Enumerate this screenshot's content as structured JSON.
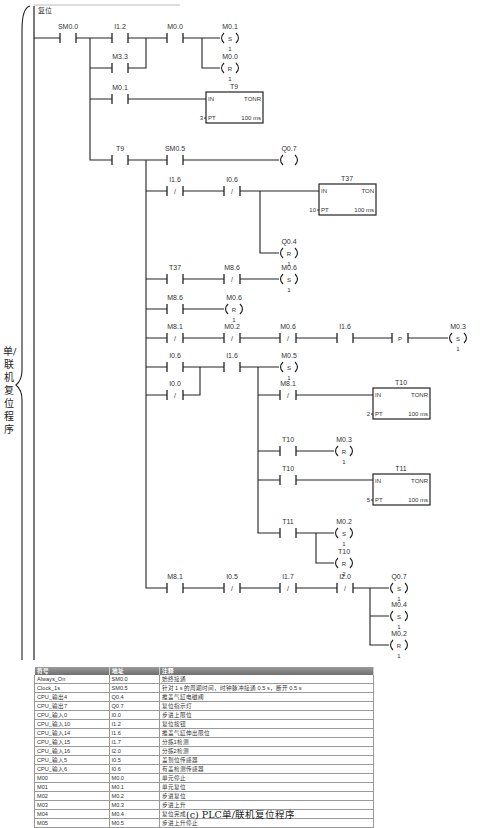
{
  "network": {
    "title": "复位"
  },
  "side_label": "单/联机复位程序",
  "caption": "(c) PLC单/联机复位程序",
  "ladder": {
    "contacts": [
      {
        "id": "c1",
        "label": "SM0.0",
        "x": 68,
        "y": 38,
        "nc": false
      },
      {
        "id": "c2",
        "label": "I1.2",
        "x": 120,
        "y": 38,
        "nc": false
      },
      {
        "id": "c3",
        "label": "M0.0",
        "x": 175,
        "y": 38,
        "nc": false
      },
      {
        "id": "c4",
        "label": "M3.3",
        "x": 120,
        "y": 68,
        "nc": false
      },
      {
        "id": "c5",
        "label": "M0.1",
        "x": 120,
        "y": 99,
        "nc": false
      },
      {
        "id": "c6",
        "label": "T9",
        "x": 120,
        "y": 160,
        "nc": false
      },
      {
        "id": "c7",
        "label": "SM0.5",
        "x": 175,
        "y": 160,
        "nc": false
      },
      {
        "id": "c8",
        "label": "I1.6",
        "x": 175,
        "y": 191,
        "nc": true
      },
      {
        "id": "c9",
        "label": "I0.6",
        "x": 232,
        "y": 191,
        "nc": true
      },
      {
        "id": "c10",
        "label": "T37",
        "x": 175,
        "y": 279,
        "nc": false
      },
      {
        "id": "c11",
        "label": "M8.6",
        "x": 232,
        "y": 279,
        "nc": true
      },
      {
        "id": "c12",
        "label": "M8.6",
        "x": 175,
        "y": 309,
        "nc": false
      },
      {
        "id": "c13",
        "label": "M8.1",
        "x": 175,
        "y": 338,
        "nc": true
      },
      {
        "id": "c14",
        "label": "M0.2",
        "x": 232,
        "y": 338,
        "nc": true
      },
      {
        "id": "c15",
        "label": "M0.6",
        "x": 288,
        "y": 338,
        "nc": true
      },
      {
        "id": "c16",
        "label": "I1.6",
        "x": 345,
        "y": 338,
        "nc": false
      },
      {
        "id": "c17",
        "label": "I0.6",
        "x": 175,
        "y": 367,
        "nc": false
      },
      {
        "id": "c18",
        "label": "I1.6",
        "x": 232,
        "y": 367,
        "nc": false
      },
      {
        "id": "c19",
        "label": "I0.0",
        "x": 175,
        "y": 395,
        "nc": true
      },
      {
        "id": "c20",
        "label": "M8.1",
        "x": 288,
        "y": 395,
        "nc": true
      },
      {
        "id": "c21",
        "label": "T10",
        "x": 288,
        "y": 451,
        "nc": false
      },
      {
        "id": "c22",
        "label": "T10",
        "x": 288,
        "y": 480,
        "nc": false
      },
      {
        "id": "c23",
        "label": "T11",
        "x": 288,
        "y": 533,
        "nc": false
      },
      {
        "id": "c24",
        "label": "M8.1",
        "x": 175,
        "y": 588,
        "nc": false
      },
      {
        "id": "c25",
        "label": "I0.5",
        "x": 232,
        "y": 588,
        "nc": true
      },
      {
        "id": "c26",
        "label": "I1.7",
        "x": 288,
        "y": 588,
        "nc": true
      },
      {
        "id": "c27",
        "label": "I2.0",
        "x": 345,
        "y": 588,
        "nc": true
      }
    ],
    "coils": [
      {
        "label": "M0.1",
        "type": "S",
        "n": "1",
        "x": 228,
        "y": 38
      },
      {
        "label": "M0.0",
        "type": "R",
        "n": "1",
        "x": 228,
        "y": 68
      },
      {
        "label": "Q0.7",
        "type": "",
        "n": "",
        "x": 287,
        "y": 160
      },
      {
        "label": "Q0.4",
        "type": "R",
        "n": "1",
        "x": 287,
        "y": 253
      },
      {
        "label": "M0.6",
        "type": "S",
        "n": "1",
        "x": 287,
        "y": 279
      },
      {
        "label": "M0.6",
        "type": "R",
        "n": "1",
        "x": 232,
        "y": 309
      },
      {
        "label": "M0.3",
        "type": "S",
        "n": "1",
        "x": 456,
        "y": 338
      },
      {
        "label": "M0.5",
        "type": "S",
        "n": "1",
        "x": 287,
        "y": 367
      },
      {
        "label": "M0.3",
        "type": "R",
        "n": "1",
        "x": 342,
        "y": 451
      },
      {
        "label": "M0.2",
        "type": "S",
        "n": "1",
        "x": 342,
        "y": 533
      },
      {
        "label": "T10",
        "type": "R",
        "n": "2",
        "x": 342,
        "y": 563
      },
      {
        "label": "Q0.7",
        "type": "S",
        "n": "1",
        "x": 397,
        "y": 588
      },
      {
        "label": "M0.4",
        "type": "S",
        "n": "1",
        "x": 397,
        "y": 616
      },
      {
        "label": "M0.2",
        "type": "R",
        "n": "1",
        "x": 397,
        "y": 645
      }
    ],
    "timers": [
      {
        "name": "T9",
        "type": "TONR",
        "pt": "3",
        "unit": "100 ms",
        "x": 206,
        "y": 92
      },
      {
        "name": "T37",
        "type": "TON",
        "pt": "10",
        "unit": "100 ms",
        "x": 319,
        "y": 184
      },
      {
        "name": "T10",
        "type": "TONR",
        "pt": "2",
        "unit": "100 ms",
        "x": 373,
        "y": 388
      },
      {
        "name": "T11",
        "type": "TONR",
        "pt": "5",
        "unit": "100 ms",
        "x": 373,
        "y": 474
      }
    ],
    "edge": {
      "label": "P",
      "x": 400,
      "y": 338
    }
  },
  "symbol_table": {
    "headers": [
      "符号",
      "地址",
      "注释"
    ],
    "rows": [
      [
        "Always_On",
        "SM0.0",
        "始终接通"
      ],
      [
        "Clock_1s",
        "SM0.5",
        "针对 1 s 的周期时间，时钟脉冲接通 0.5 s，断开 0.5 s"
      ],
      [
        "CPU_输出4",
        "Q0.4",
        "推盖气缸电磁阀"
      ],
      [
        "CPU_输出7",
        "Q0.7",
        "复位指示灯"
      ],
      [
        "CPU_输入0",
        "I0.0",
        "步进上限位"
      ],
      [
        "CPU_输入10",
        "I1.2",
        "复位按钮"
      ],
      [
        "CPU_输入14",
        "I1.6",
        "推盖气缸伸出限位"
      ],
      [
        "CPU_输入15",
        "I1.7",
        "分拣1检测"
      ],
      [
        "CPU_输入16",
        "I2.0",
        "分拣2检测"
      ],
      [
        "CPU_输入5",
        "I0.5",
        "盖到位传感器"
      ],
      [
        "CPU_输入6",
        "I0.6",
        "有盖检测传感器"
      ],
      [
        "M00",
        "M0.0",
        "单元停止"
      ],
      [
        "M01",
        "M0.1",
        "单元复位"
      ],
      [
        "M02",
        "M0.2",
        "步进复位"
      ],
      [
        "M03",
        "M0.3",
        "步进上升"
      ],
      [
        "M04",
        "M0.4",
        "复位完成"
      ],
      [
        "M05",
        "M0.5",
        "步进上升停止"
      ]
    ]
  }
}
